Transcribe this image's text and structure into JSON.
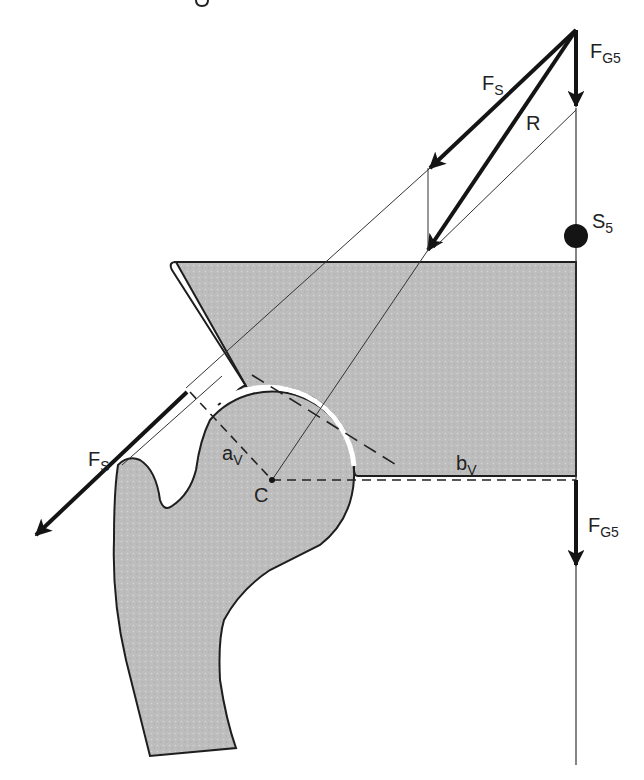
{
  "figure": {
    "type": "biomechanics free-body diagram",
    "colors": {
      "bone_fill": "#bdbdbd",
      "outline": "#1e1e1e",
      "force_arrow": "#141414",
      "guide_line": "#333333",
      "background": "#ffffff"
    }
  },
  "labels": {
    "fg5_top": {
      "main": "F",
      "sub": "G5"
    },
    "fs_top": {
      "main": "F",
      "sub": "S"
    },
    "r": {
      "main": "R"
    },
    "s5": {
      "main": "S",
      "sub": "5"
    },
    "fs_bottom": {
      "main": "F",
      "sub": "S"
    },
    "av": {
      "main": "a",
      "sub": "V"
    },
    "c": {
      "main": "C"
    },
    "bv": {
      "main": "b",
      "sub": "V"
    },
    "fg5_bottom": {
      "main": "F",
      "sub": "G5"
    }
  },
  "elements": {
    "forces": [
      {
        "name": "F_G5 (force triangle)",
        "direction": "down"
      },
      {
        "name": "F_S (force triangle)",
        "direction": "down-left"
      },
      {
        "name": "R (resultant)",
        "direction": "down-left toward C"
      },
      {
        "name": "F_S (abductor, applied at trochanter)",
        "direction": "down-left"
      },
      {
        "name": "F_G5 (applied at lever end)",
        "direction": "down"
      }
    ],
    "points": [
      {
        "name": "S5",
        "description": "center of gravity of partial body"
      },
      {
        "name": "C",
        "description": "center of rotation of femoral head"
      }
    ],
    "lever_arms": [
      {
        "name": "a_V",
        "description": "abductor lever arm"
      },
      {
        "name": "b_V",
        "description": "body weight lever arm"
      }
    ]
  }
}
